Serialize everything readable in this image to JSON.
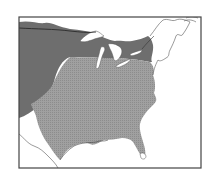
{
  "map": {
    "type": "range-map",
    "region": "Eastern United States",
    "colors": {
      "background": "#ffffff",
      "northern_range": "#6e6e6e",
      "southern_range": "#9a9a9a",
      "coastline": "#555555",
      "frame": "#444444",
      "lakes": "#ffffff"
    },
    "legend": []
  }
}
